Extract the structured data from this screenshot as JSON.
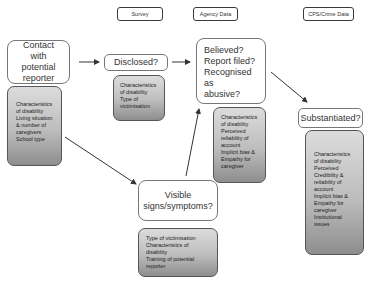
{
  "headers": {
    "survey": "Survey",
    "agency": "Agency Data",
    "cps": "CPS/Crime Data"
  },
  "nodes": {
    "contact": {
      "label": "Contact with potential reporter"
    },
    "disclosed": {
      "label": "Disclosed?"
    },
    "believed": {
      "lines": [
        "Believed?",
        "Report filed?",
        "Recognised as",
        "abusive?"
      ]
    },
    "substantiated": {
      "label": "Substantiated?"
    },
    "visible": {
      "lines": [
        "Visible",
        "signs/symptoms?"
      ]
    }
  },
  "factors": {
    "contact": [
      "Characteristics",
      "of disability",
      "Living situation",
      "& number of",
      "caregivers",
      "School type"
    ],
    "disclosed": [
      "Characteristics",
      "of disability",
      "Type of",
      "victimisation"
    ],
    "believed": [
      "Characteristics",
      "of disability",
      "Perceived",
      "reliability of",
      "account",
      "Implicit bias &",
      "Empathy for",
      "caregiver"
    ],
    "substantiated": [
      "Characteristics",
      "of disability",
      "Perceived",
      "Credibility &",
      "reliability of",
      "account",
      "Implicit bias &",
      "Empathy for",
      "caregiver",
      "Institutional",
      "issues"
    ],
    "visible": [
      "Type of victimisation",
      "Characteristics of disability",
      "Training of potential",
      "reporter"
    ]
  },
  "colors": {
    "border": "#3a3a3a",
    "arrow": "#333333",
    "factor_gradient_top": "#dcdcdc",
    "factor_gradient_bottom": "#8e8e8e"
  }
}
